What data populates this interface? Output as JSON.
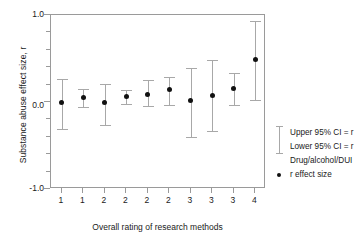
{
  "chart_data": {
    "type": "scatter",
    "title": "",
    "xlabel": "Overall rating of research methods",
    "ylabel": "Substance abuse effect size, r",
    "ylim": [
      -1.0,
      1.0
    ],
    "yticks": [
      "1.0",
      "0.0",
      "-1.0"
    ],
    "ytick_values": [
      1.0,
      0.0,
      -1.0
    ],
    "grid": false,
    "categories": [
      "1",
      "1",
      "2",
      "2",
      "2",
      "2",
      "3",
      "3",
      "3",
      "4"
    ],
    "xtick_labels": [
      "1",
      "1",
      "2",
      "2",
      "2",
      "2",
      "3",
      "3",
      "3",
      "4"
    ],
    "series": [
      {
        "name": "r effect size",
        "values": [
          0.0,
          0.05,
          0.0,
          0.06,
          0.09,
          0.14,
          0.02,
          0.08,
          0.16,
          0.49
        ],
        "upper_ci": [
          0.27,
          0.15,
          0.21,
          0.14,
          0.25,
          0.29,
          0.39,
          0.48,
          0.33,
          0.93
        ],
        "lower_ci": [
          -0.31,
          -0.06,
          -0.26,
          -0.02,
          -0.05,
          -0.03,
          -0.4,
          -0.33,
          -0.03,
          0.02
        ]
      }
    ],
    "legend_position": "right",
    "legend_entries": [
      "Upper 95% CI = r",
      "Lower 95% CI = r",
      "Drug/alcohol/DUI",
      "r effect size"
    ]
  },
  "legend": {
    "upper_ci_label": "Upper 95% CI = r",
    "lower_ci_label": "Lower 95% CI = r",
    "group_label": "Drug/alcohol/DUI",
    "point_label": "r effect size"
  },
  "axes": {
    "y_title": "Substance abuse effect size, r",
    "x_title": "Overall rating of research methods",
    "y_top": "1.0",
    "y_mid": "0.0",
    "y_bottom": "-1.0"
  },
  "colors": {
    "axis": "#9a9a9a",
    "errorbar": "#a8a8a8",
    "marker": "#111111",
    "text": "#1a1a1a",
    "background": "#ffffff"
  }
}
